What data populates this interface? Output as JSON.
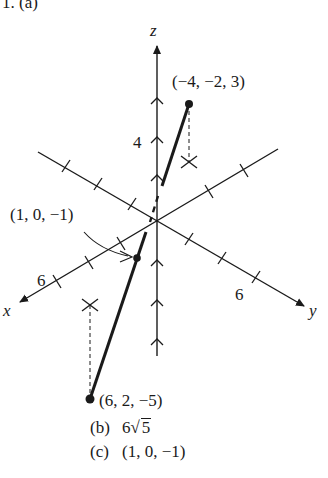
{
  "problem": {
    "header": "1. (a)"
  },
  "diagram": {
    "type": "3d-coordinate-plot",
    "axes": {
      "x": {
        "label": "x",
        "tick_label": "6"
      },
      "y": {
        "label": "y",
        "tick_label": "6"
      },
      "z": {
        "label": "z",
        "tick_label": "4"
      }
    },
    "points": [
      {
        "name": "P1",
        "label": "(−4, −2, 3)",
        "coords": [
          -4,
          -2,
          3
        ]
      },
      {
        "name": "P2",
        "label": "(6, 2, −5)",
        "coords": [
          6,
          2,
          -5
        ]
      },
      {
        "name": "midpoint",
        "label": "(1, 0, −1)",
        "coords": [
          1,
          0,
          -1
        ]
      }
    ],
    "colors": {
      "ink": "#1a1a1a",
      "background": "#ffffff"
    }
  },
  "answers": [
    {
      "tag": "(b)",
      "prefix": "6",
      "radicand": "5",
      "text": "6√5"
    },
    {
      "tag": "(c)",
      "text": "(1, 0, −1)"
    }
  ]
}
